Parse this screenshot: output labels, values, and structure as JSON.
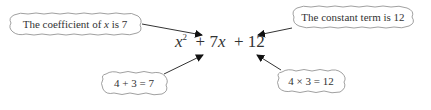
{
  "expression": {
    "x_var": "x",
    "exponent": "2",
    "term2_op": "+",
    "term2_coef": "7",
    "term2_var": "x",
    "term3_op": "+",
    "term3_const": "12"
  },
  "callouts": {
    "coefficient": {
      "text_pre": "The coefficient of ",
      "var": "x",
      "text_post": " is 7"
    },
    "constant": {
      "text": "The constant term is 12"
    },
    "sum": {
      "text": "4 + 3 = 7"
    },
    "product": {
      "text": "4 × 3 = 12"
    }
  }
}
